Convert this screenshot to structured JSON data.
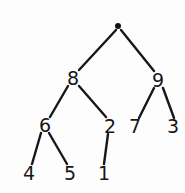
{
  "diagram": {
    "type": "binary-tree",
    "title": "",
    "background_color": "#fdfdfd",
    "stroke_color": "#171717",
    "text_color": "#161616",
    "root": {
      "label": "",
      "icon": "root-dot",
      "x": 118,
      "y": 26
    },
    "nodes": [
      {
        "id": "n8",
        "label": "8",
        "x": 73,
        "y": 78
      },
      {
        "id": "n9",
        "label": "9",
        "x": 158,
        "y": 80
      },
      {
        "id": "n6",
        "label": "6",
        "x": 45,
        "y": 125
      },
      {
        "id": "n2",
        "label": "2",
        "x": 110,
        "y": 126
      },
      {
        "id": "n7",
        "label": "7",
        "x": 135,
        "y": 126
      },
      {
        "id": "n3",
        "label": "3",
        "x": 173,
        "y": 126
      },
      {
        "id": "n4",
        "label": "4",
        "x": 29,
        "y": 173
      },
      {
        "id": "n5",
        "label": "5",
        "x": 70,
        "y": 173
      },
      {
        "id": "n1",
        "label": "1",
        "x": 104,
        "y": 173
      }
    ],
    "edges": [
      {
        "id": "e-root-8",
        "from": "root",
        "to": "n8",
        "x1": 116,
        "y1": 30,
        "x2": 79,
        "y2": 70
      },
      {
        "id": "e-root-9",
        "from": "root",
        "to": "n9",
        "x1": 121,
        "y1": 30,
        "x2": 154,
        "y2": 71
      },
      {
        "id": "e-8-6",
        "from": "n8",
        "to": "n6",
        "x1": 68,
        "y1": 86,
        "x2": 50,
        "y2": 117
      },
      {
        "id": "e-8-2",
        "from": "n8",
        "to": "n2",
        "x1": 79,
        "y1": 86,
        "x2": 106,
        "y2": 117
      },
      {
        "id": "e-9-7",
        "from": "n9",
        "to": "n7",
        "x1": 154,
        "y1": 88,
        "x2": 139,
        "y2": 118
      },
      {
        "id": "e-9-3",
        "from": "n9",
        "to": "n3",
        "x1": 163,
        "y1": 88,
        "x2": 174,
        "y2": 118
      },
      {
        "id": "e-6-4",
        "from": "n6",
        "to": "n4",
        "x1": 41,
        "y1": 133,
        "x2": 32,
        "y2": 164
      },
      {
        "id": "e-6-5",
        "from": "n6",
        "to": "n5",
        "x1": 49,
        "y1": 133,
        "x2": 67,
        "y2": 164
      },
      {
        "id": "e-2-1",
        "from": "n2",
        "to": "n1",
        "x1": 108,
        "y1": 134,
        "x2": 104,
        "y2": 164
      }
    ]
  }
}
